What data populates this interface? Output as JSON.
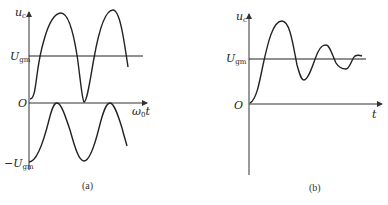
{
  "figure": {
    "panel_a": {
      "caption": "(a)",
      "y_axis_label": "u",
      "y_axis_label_sub": "c",
      "x_axis_label": "ω",
      "x_axis_label_sub": "0",
      "x_axis_label_tail": "t",
      "origin_label": "O",
      "upper_level_label": "U",
      "upper_level_label_sub": "gm",
      "lower_level_label": "−U",
      "lower_level_label_sub": "gm",
      "curves": [
        "upper waveform oscillating about U_gm, touching 0",
        "lower sinusoid between −U_gm and 0"
      ]
    },
    "panel_b": {
      "caption": "(b)",
      "y_axis_label": "u",
      "y_axis_label_sub": "c",
      "x_axis_label": "t",
      "origin_label": "O",
      "level_label": "U",
      "level_label_sub": "gm",
      "curves": [
        "damped oscillation settling to U_gm"
      ]
    }
  }
}
